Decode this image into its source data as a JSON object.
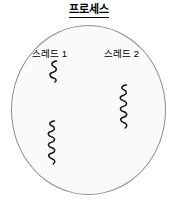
{
  "diagram": {
    "title": "프로세스",
    "type": "process-thread-diagram",
    "boundary": {
      "shape": "ellipse",
      "label": "프로세스",
      "fill_color": "#fafafa",
      "border_color": "#8c8c8c"
    },
    "threads": [
      {
        "label": "스레드 1",
        "squiggles": [
          {
            "name": "thread-1-execution-upper",
            "waves": 3,
            "length": "short"
          },
          {
            "name": "thread-1-execution-lower",
            "waves": 6,
            "length": "long"
          }
        ]
      },
      {
        "label": "스레드 2",
        "squiggles": [
          {
            "name": "thread-2-execution",
            "waves": 6,
            "length": "long"
          }
        ]
      }
    ],
    "stroke_color": "#141414",
    "text_color": "#000000",
    "background_color": "#ffffff"
  }
}
